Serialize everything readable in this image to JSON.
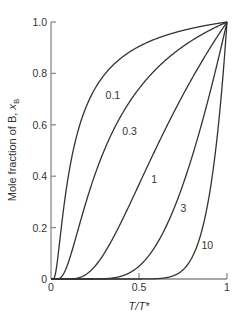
{
  "chart_data": {
    "type": "line",
    "title": "",
    "xlabel": "T/T*",
    "ylabel": "Mole fraction of B, x_B",
    "ylabel_parts": {
      "main": "Mole fraction of B, ",
      "var": "x",
      "sub": "B"
    },
    "xlabel_parts": {
      "a": "T",
      "slash": "/",
      "b": "T*"
    },
    "xlim": [
      0,
      1
    ],
    "ylim": [
      0,
      1.0
    ],
    "grid": false,
    "legend": "none (curves labelled inline)",
    "x_ticks": [
      {
        "value": 0,
        "label": "0"
      },
      {
        "value": 0.5,
        "label": "0.5"
      },
      {
        "value": 1,
        "label": "1"
      }
    ],
    "y_ticks": [
      {
        "value": 0,
        "label": "0"
      },
      {
        "value": 0.2,
        "label": "0.2"
      },
      {
        "value": 0.4,
        "label": "0.4"
      },
      {
        "value": 0.6,
        "label": "0.6"
      },
      {
        "value": 0.8,
        "label": "0.8"
      },
      {
        "value": 1.0,
        "label": "1.0"
      }
    ],
    "x": [
      0.1,
      0.2,
      0.3,
      0.4,
      0.5,
      0.6,
      0.7,
      0.8,
      0.9,
      1.0
    ],
    "series": [
      {
        "name": "0.1",
        "param": 0.1,
        "values": [
          0.407,
          0.67,
          0.792,
          0.861,
          0.905,
          0.936,
          0.958,
          0.975,
          0.989,
          1.0
        ],
        "label_pos": [
          0.31,
          0.7
        ]
      },
      {
        "name": "0.3",
        "param": 0.3,
        "values": [
          0.067,
          0.301,
          0.497,
          0.638,
          0.741,
          0.819,
          0.88,
          0.928,
          0.967,
          1.0
        ],
        "label_pos": [
          0.405,
          0.56
        ]
      },
      {
        "name": "1",
        "param": 1,
        "values": [
          0.0001,
          0.018,
          0.097,
          0.223,
          0.368,
          0.513,
          0.651,
          0.779,
          0.895,
          1.0
        ],
        "label_pos": [
          0.57,
          0.375
        ]
      },
      {
        "name": "3",
        "param": 3,
        "values": [
          0.0,
          0.0,
          0.001,
          0.011,
          0.05,
          0.135,
          0.277,
          0.472,
          0.717,
          1.0
        ],
        "label_pos": [
          0.735,
          0.26
        ]
      },
      {
        "name": "10",
        "param": 10,
        "values": [
          0.0,
          0.0,
          0.0,
          0.0,
          5e-05,
          0.001,
          0.014,
          0.082,
          0.329,
          1.0
        ],
        "label_pos": [
          0.855,
          0.115
        ]
      }
    ],
    "model": "x_B = exp[-param * (T*/T - 1)]",
    "colors": {
      "curve": "#333333",
      "axis": "#8a8a8a",
      "text": "#333333"
    }
  }
}
